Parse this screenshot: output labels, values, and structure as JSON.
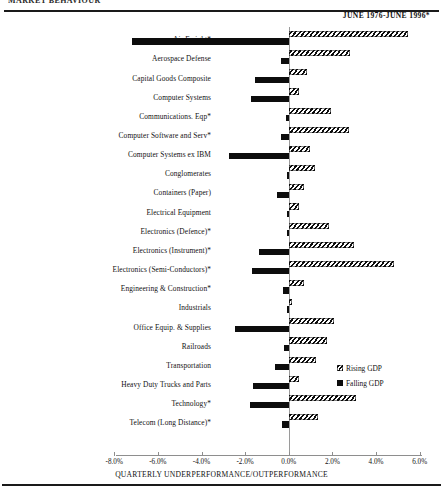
{
  "document": {
    "cropped_header": "MARKET BEHAVIOUR",
    "date_range": "JUNE 1976-JUNE 1996*"
  },
  "legend": {
    "items": [
      {
        "label": "Rising GDP",
        "swatch": "hatched",
        "color": "#0d0d0d"
      },
      {
        "label": "Falling GDP",
        "swatch": "solid",
        "color": "#0d0d0d"
      }
    ]
  },
  "chart_data": {
    "type": "bar",
    "orientation": "horizontal",
    "title": "",
    "xlabel": "QUARTERLY UNDERPERFORMANCE/OUTPERFORMANCE",
    "ylabel": "",
    "xlim": [
      -8.0,
      6.0
    ],
    "xticks": [
      "-8.0%",
      "-6.0%",
      "-4.0%",
      "-2.0%",
      "0.0%",
      "2.0%",
      "4.0%",
      "6.0%"
    ],
    "xtick_values": [
      -8.0,
      -6.0,
      -4.0,
      -2.0,
      0.0,
      2.0,
      4.0,
      6.0
    ],
    "grid": false,
    "legend_position": "middle-right",
    "categories": [
      "Air Freight*",
      "Aerospace Defense",
      "Capital Goods Composite",
      "Computer Systems",
      "Communications. Eqp*",
      "Computer Software and Serv*",
      "Computer Systems ex IBM",
      "Conglomerates",
      "Containers (Paper)",
      "Electrical Equipment",
      "Electronics (Defence)*",
      "Electronics (Instrument)*",
      "Electronics (Semi-Conductors)*",
      "Engineering & Construction*",
      "Industrials",
      "Office Equip. & Supplies",
      "Railroads",
      "Transportation",
      "Heavy Duty Trucks and Parts",
      "Technology*",
      "Telecom (Long Distance)*"
    ],
    "series": [
      {
        "name": "Rising GDP",
        "values": [
          5.45,
          2.8,
          0.85,
          0.45,
          1.95,
          2.75,
          0.95,
          1.2,
          0.7,
          0.45,
          1.85,
          3.0,
          4.8,
          0.7,
          0.15,
          2.05,
          1.75,
          1.25,
          0.45,
          3.1,
          1.35
        ]
      },
      {
        "name": "Falling GDP",
        "values": [
          -7.2,
          -0.35,
          -1.55,
          -1.75,
          -0.15,
          -0.35,
          -2.75,
          -0.1,
          -0.55,
          -0.1,
          -0.05,
          -1.35,
          -1.7,
          -0.25,
          -0.05,
          -2.45,
          -0.2,
          -0.65,
          -1.65,
          -1.8,
          -0.3
        ]
      }
    ]
  }
}
